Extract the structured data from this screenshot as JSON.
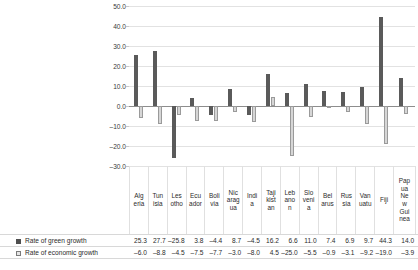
{
  "chart_data": {
    "type": "bar",
    "title": "",
    "subtitle": "",
    "xlabel": "",
    "ylabel": "",
    "ylim": [
      -30.0,
      50.0
    ],
    "grid": true,
    "legend_position": "bottom-table",
    "ytick_labels": [
      "50.0",
      "40.0",
      "30.0",
      "20.0",
      "10.0",
      "0.0",
      "–10.0",
      "–20.0",
      "–30.0"
    ],
    "ytick_values": [
      50.0,
      40.0,
      30.0,
      20.0,
      10.0,
      0.0,
      -10.0,
      -20.0,
      -30.0
    ],
    "categories": [
      "Algeria",
      "Tunisia",
      "Lesotho",
      "Ecuador",
      "Bolivia",
      "Nicaragua",
      "India",
      "Tajikistan",
      "Lebanon",
      "Slovenia",
      "Belarus",
      "Russia",
      "Vanuatu",
      "Fiji",
      "Papua New Guinea"
    ],
    "category_label_lines": [
      [
        "Alg",
        "eria"
      ],
      [
        "Tun",
        "isia"
      ],
      [
        "Les",
        "otho"
      ],
      [
        "Ecu",
        "ador"
      ],
      [
        "Boli",
        "via"
      ],
      [
        "Nic",
        "arag",
        "ua"
      ],
      [
        "Indi",
        "a"
      ],
      [
        "Taji",
        "kist",
        "an"
      ],
      [
        "Leb",
        "ano",
        "n"
      ],
      [
        "Slo",
        "veni",
        "a"
      ],
      [
        "Bel",
        "arus"
      ],
      [
        "Rus",
        "sia"
      ],
      [
        "Van",
        "uatu"
      ],
      [
        "Fiji"
      ],
      [
        "Pap",
        "ua",
        "Ne",
        "w",
        "Gui",
        "nea"
      ]
    ],
    "series": [
      {
        "name": "Rate of green growth",
        "color": "#5a5a5a",
        "values": [
          25.3,
          27.7,
          -25.8,
          3.8,
          -4.4,
          8.7,
          -4.5,
          16.2,
          6.6,
          11.0,
          7.4,
          6.9,
          9.7,
          44.3,
          14.0
        ],
        "value_labels": [
          "25.3",
          "27.7",
          "–25.8",
          "3.8",
          "–4.4",
          "8.7",
          "–4.5",
          "16.2",
          "6.6",
          "11.0",
          "7.4",
          "6.9",
          "9.7",
          "44.3",
          "14.0"
        ]
      },
      {
        "name": "Rate of economic growth",
        "color": "#d6d6d6",
        "values": [
          -6.0,
          -8.8,
          -4.5,
          -7.5,
          -7.7,
          -3.0,
          -8.0,
          4.5,
          -25.0,
          -5.5,
          -0.9,
          -3.1,
          -9.2,
          -19.0,
          -3.9
        ],
        "value_labels": [
          "–6.0",
          "–8.8",
          "–4.5",
          "–7.5",
          "–7.7",
          "–3.0",
          "–8.0",
          "4.5",
          "–25.0",
          "–5.5",
          "–0.9",
          "–3.1",
          "–9.2",
          "–19.0",
          "–3.9"
        ]
      }
    ]
  },
  "colors": {
    "green_growth": "#5a5a5a",
    "economic_growth": "#d6d6d6",
    "economic_growth_border": "#9a9a9a",
    "gridline": "#e2e2e2",
    "zeroline": "#8d8d8d",
    "table_rule": "#d8d8d8",
    "text": "#2b2b2b",
    "background": "#ffffff"
  }
}
